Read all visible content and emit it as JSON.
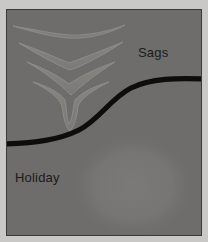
{
  "figure": {
    "labels": {
      "sags": "Sags",
      "holiday": "Holiday"
    },
    "colors": {
      "outer_background": "#c9c8c6",
      "panel_background": "#6e6d6b",
      "panel_border": "#3a3a3a",
      "sag_fill": "#7e7d7a",
      "sag_outline": "#8c8b88",
      "curve": "#0d0d0d",
      "blob_fill": "#787775",
      "label_text": "#1b1b1b"
    },
    "diagram": {
      "type": "coating-defect-profile",
      "panel": {
        "x": 6,
        "y": 9,
        "width": 196,
        "height": 227
      },
      "boundary_curve": {
        "description": "thick black S-shaped profile line dividing upper sag region from lower holiday region",
        "stroke_width": 5,
        "left_end": {
          "x": 0,
          "y": 134
        },
        "right_end": {
          "x": 196,
          "y": 70
        },
        "inflection": {
          "x": 98,
          "y": 102
        }
      },
      "sag_profiles": [
        {
          "index": 1,
          "name": "shallow-sag",
          "cx": 62,
          "cy": 22,
          "half_width": 56,
          "depth": 9,
          "severity": "slight"
        },
        {
          "index": 2,
          "name": "moderate-sag",
          "cx": 64,
          "cy": 40,
          "half_width": 52,
          "depth": 17,
          "severity": "moderate"
        },
        {
          "index": 3,
          "name": "deep-sag",
          "cx": 64,
          "cy": 58,
          "half_width": 44,
          "depth": 24,
          "severity": "deep"
        },
        {
          "index": 4,
          "name": "curtain-sag",
          "cx": 64,
          "cy": 78,
          "half_width": 38,
          "depth": 34,
          "severity": "severe"
        }
      ],
      "holiday_blob": {
        "description": "soft lighter rounded void region in lower right of panel",
        "cx": 128,
        "cy": 178,
        "rx": 62,
        "ry": 52
      }
    }
  }
}
